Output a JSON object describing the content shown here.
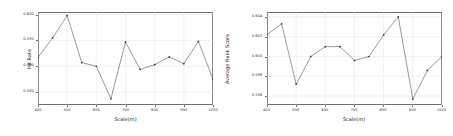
{
  "chart_data": [
    {
      "type": "line",
      "panel": "left",
      "title": "",
      "xlabel": "Scale(m)",
      "ylabel": "Hit Rate",
      "x": [
        400,
        450,
        500,
        550,
        600,
        650,
        700,
        750,
        800,
        850,
        900,
        950,
        1000
      ],
      "values": [
        0.5917,
        0.5955,
        0.5998,
        0.5907,
        0.59,
        0.5837,
        0.5947,
        0.5894,
        0.5903,
        0.5918,
        0.5905,
        0.5948,
        0.5875
      ],
      "series": [
        {
          "name": "Hit Rate",
          "values": [
            0.5917,
            0.5955,
            0.5998,
            0.5907,
            0.59,
            0.5837,
            0.5947,
            0.5894,
            0.5903,
            0.5918,
            0.5905,
            0.5948,
            0.5875
          ]
        }
      ],
      "xlim": [
        400,
        1000
      ],
      "ylim": [
        0.5825,
        0.6005
      ],
      "xticks": [
        400,
        500,
        600,
        700,
        800,
        900,
        1000
      ],
      "xticklabels": [
        "400",
        "500",
        "600",
        "700",
        "800",
        "900",
        "1000"
      ],
      "yticks": [
        0.585,
        0.59,
        0.595,
        0.6
      ],
      "yticklabels": [
        "0.585",
        "0.590",
        "0.595",
        "0.600"
      ],
      "grid": true,
      "legend": "none",
      "marker": "dot",
      "line_color": "#555555",
      "grid_color": "#e2e2e2",
      "frame_color": "#6e6e6e"
    },
    {
      "type": "line",
      "panel": "right",
      "title": "",
      "xlabel": "Scale(m)",
      "ylabel": "Average Rank Score",
      "x": [
        400,
        450,
        500,
        550,
        600,
        650,
        700,
        750,
        800,
        850,
        900,
        950,
        1000
      ],
      "values": [
        0.6022,
        0.6033,
        0.5972,
        0.6,
        0.601,
        0.601,
        0.5996,
        0.6,
        0.6022,
        0.604,
        0.5957,
        0.5986,
        0.6
      ],
      "series": [
        {
          "name": "Average Rank Score",
          "values": [
            0.6022,
            0.6033,
            0.5972,
            0.6,
            0.601,
            0.601,
            0.5996,
            0.6,
            0.6022,
            0.604,
            0.5957,
            0.5986,
            0.6
          ]
        }
      ],
      "xlim": [
        400,
        1000
      ],
      "ylim": [
        0.5951,
        0.6045
      ],
      "xticks": [
        400,
        500,
        600,
        700,
        800,
        900,
        1000
      ],
      "xticklabels": [
        "400",
        "500",
        "600",
        "700",
        "800",
        "900",
        "1000"
      ],
      "yticks": [
        0.596,
        0.598,
        0.6,
        0.602,
        0.604
      ],
      "yticklabels": [
        "0.596",
        "0.598",
        "0.600",
        "0.602",
        "0.604"
      ],
      "grid": true,
      "legend": "none",
      "marker": "dot",
      "line_color": "#555555",
      "grid_color": "#e2e2e2",
      "frame_color": "#6e6e6e"
    }
  ]
}
